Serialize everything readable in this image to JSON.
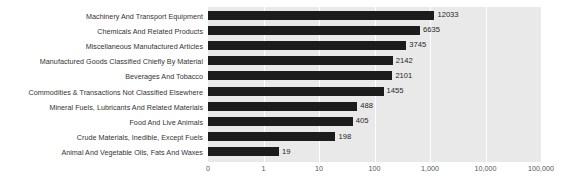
{
  "chart_data": {
    "type": "bar",
    "orientation": "horizontal",
    "title": "",
    "subtitle": "",
    "xlabel": "",
    "ylabel": "",
    "xscale": "log",
    "grid": true,
    "legend": false,
    "xticks": [
      "0",
      "1",
      "10",
      "100",
      "1,000",
      "10,000",
      "100,000"
    ],
    "xtick_values": [
      0,
      1,
      10,
      100,
      1000,
      10000,
      100000
    ],
    "xlim": [
      0,
      100000
    ],
    "categories": [
      "Machinery And Transport Equipment",
      "Chemicals And Related Products",
      "Miscellaneous Manufactured Articles",
      "Manufactured Goods Classified Chiefly By Material",
      "Beverages And Tobacco",
      "Commodities & Transactions Not Classified Elsewhere",
      "Mineral Fuels, Lubricants And Related Materials",
      "Food And Live Animals",
      "Crude Materials, Inedible, Except Fuels",
      "Animal And Vegetable Oils, Fats And Waxes"
    ],
    "values": [
      12033,
      6635,
      3745,
      2142,
      2101,
      1455,
      488,
      405,
      198,
      19
    ],
    "value_labels": [
      "12033",
      "6635",
      "3745",
      "2142",
      "2101",
      "1455",
      "488",
      "405",
      "198",
      "19"
    ],
    "colors": {
      "bar": "#1c1c1c",
      "plot_background": "#e9e9e9",
      "page_background": "#ffffff",
      "gridline": "#ffffff",
      "category_label": "#333333",
      "value_label": "#262626",
      "tick_label": "#555555"
    }
  }
}
